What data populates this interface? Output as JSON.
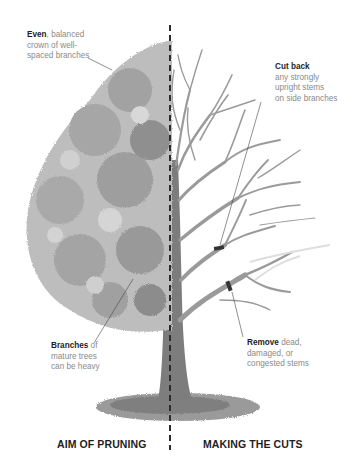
{
  "diagram": {
    "title_left": "AIM OF PRUNING",
    "title_right": "MAKING THE CUTS",
    "annotations": {
      "even": {
        "bold": "Even",
        "rest": ", balanced",
        "line2": "crown of well-",
        "line3": "spaced branches"
      },
      "cut_back": {
        "bold": "Cut back",
        "line2": "any strongly",
        "line3": "upright stems",
        "line4": "on side branches"
      },
      "branches": {
        "bold": "Branches",
        "rest": " of",
        "line2": "mature trees",
        "line3": "can be heavy"
      },
      "remove": {
        "bold": "Remove",
        "rest": " dead,",
        "line2": "damaged, or",
        "line3": "congested stems"
      }
    },
    "colors": {
      "foliage_light": "#bdbdbd",
      "foliage_mid": "#a6a6a6",
      "foliage_dark": "#8c8c8c",
      "trunk": "#7d7d7d",
      "branches": "#9a9a9a",
      "divider": "#2b2b2b",
      "cut_mark": "#333333",
      "ground": "#8f8f8f"
    }
  }
}
